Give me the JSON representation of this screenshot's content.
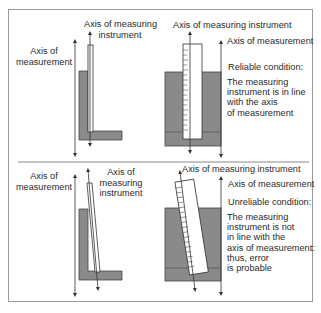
{
  "colors": {
    "block": "#8a8a8a",
    "block_dark": "#6d6d6d",
    "line": "#333333",
    "frame": "#9a9a9a",
    "text": "#2a2a2a"
  },
  "top_panel": {
    "left": {
      "axis_measurement_label": [
        "Axis of",
        "measurement"
      ],
      "axis_instrument_label": "Axis of measuring",
      "axis_instrument_label_2": "instrument"
    },
    "right": {
      "axis_instrument_label": "Axis of measuring instrument",
      "axis_measurement_label": "Axis of measurement",
      "condition_title": "Reliable condition:",
      "condition_text": [
        "The measuring",
        "instrument  is in line",
        "with the axis",
        "of measurement"
      ]
    }
  },
  "bottom_panel": {
    "left": {
      "axis_measurement_label": [
        "Axis of",
        "measurement"
      ],
      "axis_instrument_label": [
        "Axis of",
        "measuring",
        "instrument"
      ]
    },
    "right": {
      "axis_instrument_label": "Axis of measuring instrument",
      "axis_measurement_label": "Axis of measurement",
      "condition_title": "Unreliable condition:",
      "condition_text": [
        "The measuring",
        "instrument  is not",
        "in line with the",
        "axis of measurement:",
        "thus,  error",
        "is probable"
      ]
    }
  }
}
